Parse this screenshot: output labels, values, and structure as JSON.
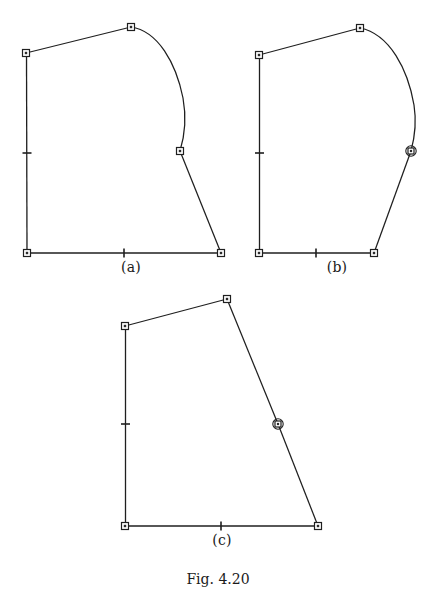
{
  "figure": {
    "caption": "Fig. 4.20",
    "background_color": "#ffffff",
    "ink_color": "#1f1f1f",
    "panels": [
      {
        "id": "a",
        "label": "(a)",
        "label_x": 131,
        "label_y": 268,
        "description": "Closed outline with straight left and bottom axes, a straight upper-left chord, a convex curved right-upper boundary ending at a mid-right node, and a straight lower-right segment to the bottom-right corner.",
        "nodes": [
          {
            "name": "top-left",
            "type": "square",
            "x": 26,
            "y": 53
          },
          {
            "name": "apex",
            "type": "square",
            "x": 131,
            "y": 27
          },
          {
            "name": "mid-right",
            "type": "square",
            "x": 180,
            "y": 151
          },
          {
            "name": "bottom-right",
            "type": "square",
            "x": 221,
            "y": 253
          },
          {
            "name": "bottom-left",
            "type": "square",
            "x": 27,
            "y": 253
          }
        ],
        "ticks": [
          {
            "name": "left-axis-tick",
            "orientation": "horizontal",
            "x": 27,
            "y": 153,
            "length": 9
          },
          {
            "name": "bottom-axis-tick",
            "orientation": "vertical",
            "x": 124,
            "y": 253,
            "length": 9
          }
        ],
        "curve_path": "M131,27 C158,31 176,63 183,98 C187,120 184,138 180,151",
        "straight_segments": [
          {
            "name": "upper-left-chord",
            "from": [
              26,
              53
            ],
            "to": [
              131,
              27
            ]
          },
          {
            "name": "lower-right-edge",
            "from": [
              180,
              151
            ],
            "to": [
              221,
              253
            ]
          },
          {
            "name": "left-axis",
            "from": [
              26,
              53
            ],
            "to": [
              27,
              253
            ]
          },
          {
            "name": "bottom-axis",
            "from": [
              27,
              253
            ],
            "to": [
              221,
              253
            ]
          }
        ]
      },
      {
        "id": "b",
        "label": "(b)",
        "label_x": 337,
        "label_y": 268,
        "description": "Same outline as (a) but the curved right boundary extends lower, the mid-right node is drawn as a circled square, and the bottom-right corner is moved inward to the left.",
        "nodes": [
          {
            "name": "top-left",
            "type": "square",
            "x": 259,
            "y": 55
          },
          {
            "name": "apex",
            "type": "square",
            "x": 360,
            "y": 28
          },
          {
            "name": "mid-right",
            "type": "circled-square",
            "x": 411,
            "y": 151
          },
          {
            "name": "bottom-right",
            "type": "square",
            "x": 374,
            "y": 253
          },
          {
            "name": "bottom-left",
            "type": "square",
            "x": 259,
            "y": 253
          }
        ],
        "ticks": [
          {
            "name": "left-axis-tick",
            "orientation": "horizontal",
            "x": 259,
            "y": 153,
            "length": 9
          },
          {
            "name": "bottom-axis-tick",
            "orientation": "vertical",
            "x": 316,
            "y": 253,
            "length": 9
          }
        ],
        "curve_path": "M360,28 C390,34 408,70 414,105 C417,124 414,140 411,151",
        "straight_segments": [
          {
            "name": "upper-left-chord",
            "from": [
              259,
              55
            ],
            "to": [
              360,
              28
            ]
          },
          {
            "name": "lower-right-edge",
            "from": [
              411,
              151
            ],
            "to": [
              374,
              253
            ]
          },
          {
            "name": "left-axis",
            "from": [
              259,
              55
            ],
            "to": [
              259,
              253
            ]
          },
          {
            "name": "bottom-axis",
            "from": [
              259,
              253
            ],
            "to": [
              374,
              253
            ]
          }
        ]
      },
      {
        "id": "c",
        "label": "(c)",
        "label_x": 221,
        "label_y": 541,
        "description": "Quadrilateral with all straight edges: left vertical axis, bottom horizontal axis, upper-left chord rising to an apex, and a long straight slanted right edge carrying a circled-square node.",
        "nodes": [
          {
            "name": "top-left",
            "type": "square",
            "x": 125,
            "y": 326
          },
          {
            "name": "apex",
            "type": "square",
            "x": 227,
            "y": 299
          },
          {
            "name": "mid-right",
            "type": "circled-square",
            "x": 278,
            "y": 424
          },
          {
            "name": "bottom-right",
            "type": "square",
            "x": 318,
            "y": 526
          },
          {
            "name": "bottom-left",
            "type": "square",
            "x": 125,
            "y": 526
          }
        ],
        "ticks": [
          {
            "name": "left-axis-tick",
            "orientation": "horizontal",
            "x": 125,
            "y": 424,
            "length": 9
          },
          {
            "name": "bottom-axis-tick",
            "orientation": "vertical",
            "x": 221,
            "y": 526,
            "length": 9
          }
        ],
        "curve_path": "",
        "straight_segments": [
          {
            "name": "upper-left-chord",
            "from": [
              125,
              326
            ],
            "to": [
              227,
              299
            ]
          },
          {
            "name": "upper-right-edge",
            "from": [
              227,
              299
            ],
            "to": [
              278,
              424
            ]
          },
          {
            "name": "lower-right-edge",
            "from": [
              278,
              424
            ],
            "to": [
              318,
              526
            ]
          },
          {
            "name": "left-axis",
            "from": [
              125,
              326
            ],
            "to": [
              125,
              526
            ]
          },
          {
            "name": "bottom-axis",
            "from": [
              125,
              526
            ],
            "to": [
              318,
              526
            ]
          }
        ]
      }
    ]
  }
}
